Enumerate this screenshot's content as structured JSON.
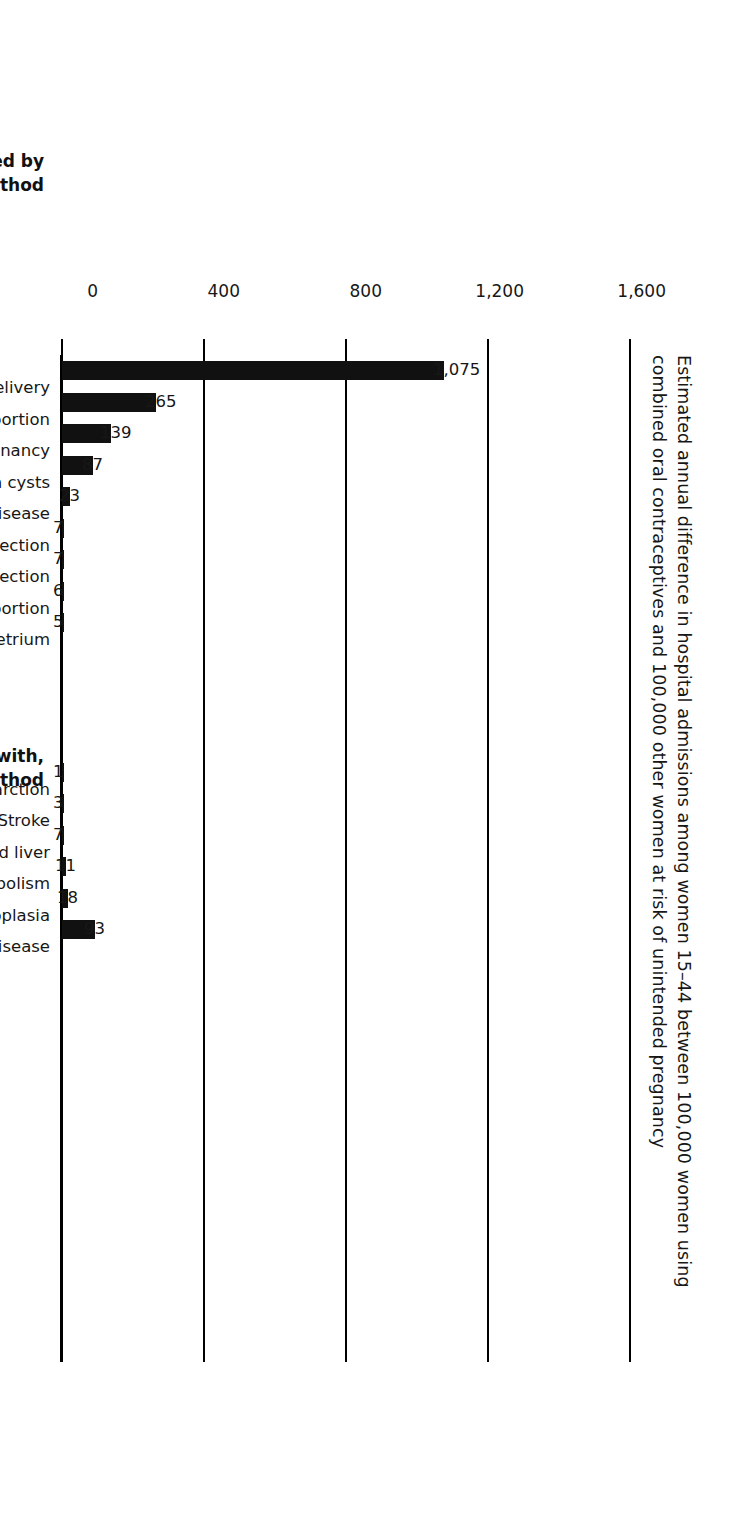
{
  "chart_data": {
    "type": "bar",
    "title": "Estimated annual difference in hospital admissions among women 15–44 between 100,000 women using combined oral contraceptives and 100,000 other women at risk of unintended pregnancy",
    "title_line1": "Estimated annual difference in hospital admissions among women 15–44 between 100,000 women using",
    "title_line2": "combined oral contraceptives and 100,000 other women at risk of unintended pregnancy",
    "xlabel": "",
    "ylabel": "",
    "ylim": [
      0,
      1600
    ],
    "yticks": [
      0,
      400,
      800,
      1200,
      1600
    ],
    "ytick_labels": [
      "0",
      "400",
      "800",
      "1,200",
      "1,600"
    ],
    "grid": true,
    "legend": "none",
    "orientation": "vertical-bars-page-rotated-90",
    "groups": [
      {
        "heading_line1": "Hospital admissions avoided by",
        "heading_line2": "use of the method",
        "categories": [
          "Cesarean delivery",
          "Spontaneous abortion",
          "Ectopic pregnancy",
          "Ovarian cysts",
          "Benign breast disease",
          "Upper genital tract infection",
          "Urinary tract infection",
          "Complications of induced abortion",
          "Invasive cancers of ovary and endometrium"
        ],
        "values": [
          1075,
          265,
          139,
          87,
          23,
          7,
          7,
          6,
          5
        ],
        "value_labels": [
          "1,075",
          "265",
          "139",
          "87",
          "23",
          "7",
          "7",
          "6",
          "5"
        ]
      },
      {
        "heading_line1": "Hospital admissions associated with,",
        "heading_line2": "or not avoided by, use of the method",
        "categories": [
          "Myocardial infarction",
          "Stroke",
          "Invasive cancers of breast, cervix, and liver",
          "Venous thrombosis and embolism",
          "Cervical intraepithelial neoplasia",
          "Gallbladder disease"
        ],
        "values": [
          1,
          3,
          7,
          11,
          18,
          93
        ],
        "value_labels": [
          "1",
          "3",
          "7",
          "11",
          "18",
          "93"
        ]
      }
    ],
    "categories": [
      "Cesarean delivery",
      "Spontaneous abortion",
      "Ectopic pregnancy",
      "Ovarian cysts",
      "Benign breast disease",
      "Upper genital tract infection",
      "Urinary tract infection",
      "Complications of induced abortion",
      "Invasive cancers of ovary and endometrium",
      "Myocardial infarction",
      "Stroke",
      "Invasive cancers of breast, cervix, and liver",
      "Venous thrombosis and embolism",
      "Cervical intraepithelial neoplasia",
      "Gallbladder disease"
    ],
    "values": [
      1075,
      265,
      139,
      87,
      23,
      7,
      7,
      6,
      5,
      1,
      3,
      7,
      11,
      18,
      93
    ],
    "colors": {
      "bar": "#111111",
      "axis": "#000000",
      "text": "#171717",
      "background": "#ffffff"
    }
  }
}
